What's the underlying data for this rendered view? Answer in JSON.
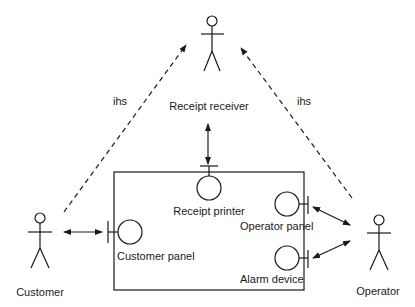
{
  "diagram": {
    "type": "UML collaboration / context diagram",
    "actors": [
      {
        "id": "receipt-receiver",
        "label": "Receipt receiver"
      },
      {
        "id": "customer",
        "label": "Customer"
      },
      {
        "id": "operator",
        "label": "Operator"
      }
    ],
    "interfaces": [
      {
        "id": "receipt-printer",
        "label": "Receipt printer"
      },
      {
        "id": "customer-panel",
        "label": "Customer panel"
      },
      {
        "id": "operator-panel",
        "label": "Operator panel"
      },
      {
        "id": "alarm-device",
        "label": "Alarm device"
      }
    ],
    "relations": [
      {
        "from": "customer",
        "to": "receipt-receiver",
        "style": "dashed",
        "label": "ihs"
      },
      {
        "from": "operator",
        "to": "receipt-receiver",
        "style": "dashed",
        "label": "ihs"
      },
      {
        "from": "receipt-receiver",
        "to": "receipt-printer",
        "style": "solid-bidirectional"
      },
      {
        "from": "customer",
        "to": "customer-panel",
        "style": "solid-bidirectional"
      },
      {
        "from": "operator",
        "to": "operator-panel",
        "style": "solid-bidirectional"
      },
      {
        "from": "operator",
        "to": "alarm-device",
        "style": "solid-bidirectional"
      }
    ],
    "labels": {
      "ihs_left": "ihs",
      "ihs_right": "ihs"
    }
  }
}
